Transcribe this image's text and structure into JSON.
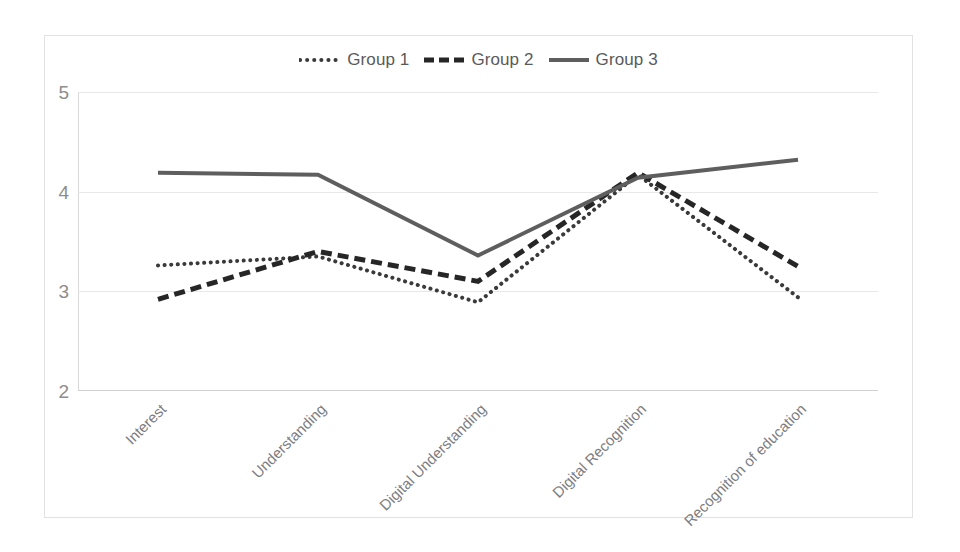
{
  "chart_data": {
    "type": "line",
    "title": "",
    "xlabel": "",
    "ylabel": "",
    "categories": [
      "Interest",
      "Understanding",
      "Digital Understanding",
      "Digital Recognition",
      "Recognition of education"
    ],
    "series": [
      {
        "name": "Group 1",
        "values": [
          3.26,
          3.35,
          2.89,
          4.17,
          2.94
        ],
        "style": "dotted",
        "color": "#3a3a3a"
      },
      {
        "name": "Group 2",
        "values": [
          2.92,
          3.4,
          3.1,
          4.19,
          3.25
        ],
        "style": "dashed",
        "color": "#262626"
      },
      {
        "name": "Group 3",
        "values": [
          4.19,
          4.17,
          3.36,
          4.14,
          4.32
        ],
        "style": "solid",
        "color": "#5e5e5e"
      }
    ],
    "ylim": [
      2,
      5
    ],
    "yticks": [
      2,
      3,
      4,
      5
    ],
    "ytick_labels": [
      "2",
      "3",
      "4",
      "5"
    ],
    "grid": true,
    "grid_axis": "y",
    "legend_position": "top",
    "legend": [
      "Group 1",
      "Group 2",
      "Group 3"
    ]
  },
  "axes": {
    "y_labels": [
      "5",
      "4",
      "3",
      "2"
    ],
    "x_labels": [
      "Interest",
      "Understanding",
      "Digital Understanding",
      "Digital Recognition",
      "Recognition of education"
    ]
  },
  "legend": {
    "items": [
      {
        "label": "Group 1",
        "icon": "dotted-line-swatch"
      },
      {
        "label": "Group 2",
        "icon": "dashed-line-swatch"
      },
      {
        "label": "Group 3",
        "icon": "solid-line-swatch"
      }
    ]
  }
}
